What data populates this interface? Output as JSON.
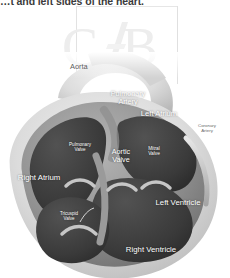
{
  "top_text": "…t and left sides of the heart.",
  "watermark": {
    "left_letter": "C",
    "right_letter": "B"
  },
  "figure": {
    "name": "heart-anatomy-diagram",
    "labels": [
      {
        "key": "aorta",
        "text": "Aorta"
      },
      {
        "key": "pulmonary_artery",
        "text": "Pulmonary\nArtery"
      },
      {
        "key": "left_atrium",
        "text": "Left Atrium"
      },
      {
        "key": "coronary_artery",
        "text": "Coronary\nArtery"
      },
      {
        "key": "pulmonary_valve",
        "text": "Pulmonary\nValve"
      },
      {
        "key": "aortic_valve",
        "text": "Aortic\nValve"
      },
      {
        "key": "mitral_valve",
        "text": "Mitral\nValve"
      },
      {
        "key": "right_atrium",
        "text": "Right Atrium"
      },
      {
        "key": "left_ventricle",
        "text": "Left Ventricle"
      },
      {
        "key": "tricuspid_valve",
        "text": "Tricuspid\nValve"
      },
      {
        "key": "right_ventricle",
        "text": "Right Ventricle"
      }
    ]
  },
  "colors": {
    "chamber_dark": "#3f3f3f",
    "wall_mid": "#8e8e8e",
    "wall_light": "#c9c9c9",
    "outer_light": "#dedede",
    "background": "#ffffff",
    "label_light": "#ffffff",
    "label_dark": "#5d5d5d",
    "watermark": "#ededed"
  }
}
